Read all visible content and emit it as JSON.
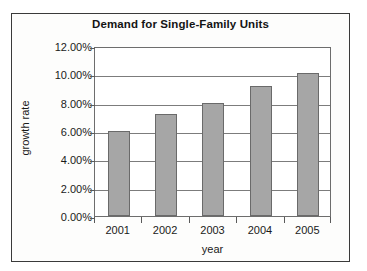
{
  "chart_data": {
    "type": "bar",
    "title": "Demand for Single-Family Units",
    "xlabel": "year",
    "ylabel": "growth rate",
    "categories": [
      "2001",
      "2002",
      "2003",
      "2004",
      "2005"
    ],
    "values": [
      6.0,
      7.2,
      8.0,
      9.2,
      10.1
    ],
    "value_labels": [
      "6.00%",
      "7.20%",
      "8.00%",
      "9.20%",
      "10.10%"
    ],
    "ylim": [
      0,
      12
    ],
    "ytick_values": [
      0,
      2,
      4,
      6,
      8,
      10,
      12
    ],
    "ytick_labels": [
      "0.00%",
      "2.00%",
      "4.00%",
      "6.00%",
      "8.00%",
      "10.00%",
      "12.00%"
    ],
    "grid": true,
    "legend": false,
    "legend_position": "none",
    "series": [
      {
        "name": "growth rate",
        "values": [
          6.0,
          7.2,
          8.0,
          9.2,
          10.1
        ]
      }
    ],
    "colors": {
      "bar_fill": "#a6a6a6",
      "bar_border": "#6a6a6a",
      "gridline": "#7c7c7c",
      "plot_border": "#6d6d6d",
      "frame_border": "#3a3a3a",
      "background": "#ffffff",
      "text": "#1a1a1a"
    }
  }
}
